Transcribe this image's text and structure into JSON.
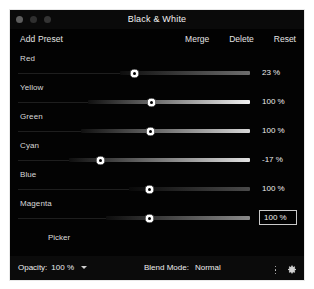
{
  "window": {
    "title": "Black & White",
    "traffic_lights": [
      "close-button",
      "minimize-button",
      "zoom-button"
    ]
  },
  "toolbar": {
    "add_preset_label": "Add Preset",
    "merge_label": "Merge",
    "delete_label": "Delete",
    "reset_label": "Reset"
  },
  "sliders": [
    {
      "label": "Red",
      "value_text": "23 %",
      "percent": 23,
      "knob_pos": 50.0,
      "grad_start": 44.0,
      "grad_end": 100,
      "grad_from": "#0d0d0d",
      "grad_to": "#6d6d6d",
      "boxed": false
    },
    {
      "label": "Yellow",
      "value_text": "100 %",
      "percent": 100,
      "knob_pos": 57.5,
      "grad_start": 30.0,
      "grad_end": 100,
      "grad_from": "#101010",
      "grad_to": "#f2f2f2",
      "boxed": false
    },
    {
      "label": "Green",
      "value_text": "100 %",
      "percent": 100,
      "knob_pos": 57.0,
      "grad_start": 27.0,
      "grad_end": 100,
      "grad_from": "#101010",
      "grad_to": "#d8d8d8",
      "boxed": false
    },
    {
      "label": "Cyan",
      "value_text": "-17 %",
      "percent": -17,
      "knob_pos": 35.5,
      "grad_start": 22.0,
      "grad_end": 100,
      "grad_from": "#0f0f0f",
      "grad_to": "#e2e2e2",
      "boxed": false
    },
    {
      "label": "Blue",
      "value_text": "100 %",
      "percent": 100,
      "knob_pos": 56.5,
      "grad_start": 48.0,
      "grad_end": 100,
      "grad_from": "#090909",
      "grad_to": "#4a4a4a",
      "boxed": false
    },
    {
      "label": "Magenta",
      "value_text": "100 %",
      "percent": 100,
      "knob_pos": 56.5,
      "grad_start": 38.0,
      "grad_end": 100,
      "grad_from": "#0d0d0d",
      "grad_to": "#8a8a8a",
      "boxed": true
    }
  ],
  "picker": {
    "label": "Picker"
  },
  "bottom_bar": {
    "opacity_label": "Opacity:",
    "opacity_value": "100 %",
    "blend_mode_label": "Blend Mode:",
    "blend_mode_value": "Normal",
    "more_icon": "more-options-icon",
    "settings_icon": "gear-icon"
  },
  "colors": {
    "window_bg": "#030303",
    "titlebar_bg": "#0a0a0a",
    "bottombar_bg": "#0b0b0b",
    "text": "#ededed",
    "border": "#e8e8e8",
    "knob": "#ffffff"
  }
}
